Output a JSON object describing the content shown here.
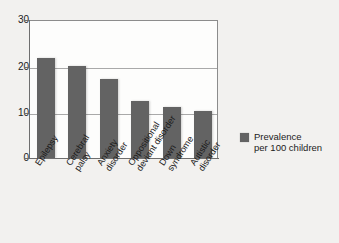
{
  "chart_data": {
    "type": "bar",
    "title": "",
    "subtitle": "",
    "xlabel": "",
    "ylabel": "",
    "ylim": [
      0,
      30
    ],
    "yticks": [
      0,
      10,
      20,
      30
    ],
    "grid": "horizontal",
    "legend_position": "right",
    "categories": [
      "Epilepsy",
      "Cerebral\npalsy",
      "Anxiety\ndisorder",
      "Oppositional\ndeviant disorder",
      "Down\nsyndrome",
      "Autistic\ndisorder"
    ],
    "series": [
      {
        "name": "Prevalence\nper 100 children",
        "color": "#636363",
        "values": [
          21.8,
          20.0,
          17.1,
          12.4,
          11.1,
          10.2
        ]
      }
    ]
  },
  "legend": {
    "label": "Prevalence\nper 100 children",
    "swatch_color": "#636363"
  },
  "axes": {
    "y_tick_labels": [
      "0",
      "10",
      "20",
      "30"
    ],
    "x_tick_labels": [
      "Epilepsy",
      "Cerebral\npalsy",
      "Anxiety\ndisorder",
      "Oppositional\ndeviant disorder",
      "Down\nsyndrome",
      "Autistic\ndisorder"
    ]
  }
}
